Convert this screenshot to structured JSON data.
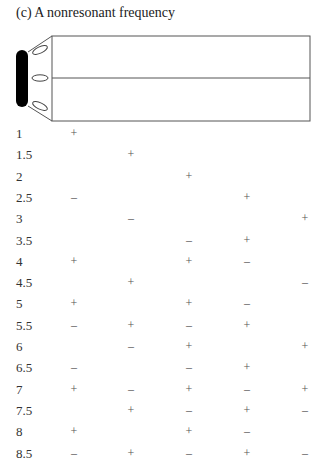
{
  "title": "(c) A nonresonant frequency",
  "figure": {
    "speaker_color": "#000000",
    "tube_line_color": "#555555"
  },
  "table": {
    "columns": 5,
    "rows": [
      {
        "label": "1",
        "signs": [
          "+",
          "",
          "",
          "",
          ""
        ]
      },
      {
        "label": "1.5",
        "signs": [
          "",
          "+",
          "",
          "",
          ""
        ]
      },
      {
        "label": "2",
        "signs": [
          "",
          "",
          "+",
          "",
          ""
        ]
      },
      {
        "label": "2.5",
        "signs": [
          "–",
          "",
          "",
          "+",
          ""
        ]
      },
      {
        "label": "3",
        "signs": [
          "",
          "–",
          "",
          "",
          "+"
        ]
      },
      {
        "label": "3.5",
        "signs": [
          "",
          "",
          "–",
          "+",
          ""
        ]
      },
      {
        "label": "4",
        "signs": [
          "+",
          "",
          "+",
          "–",
          ""
        ]
      },
      {
        "label": "4.5",
        "signs": [
          "",
          "+",
          "",
          "",
          "–"
        ]
      },
      {
        "label": "5",
        "signs": [
          "+",
          "",
          "+",
          "–",
          ""
        ]
      },
      {
        "label": "5.5",
        "signs": [
          "–",
          "+",
          "–",
          "+",
          ""
        ]
      },
      {
        "label": "6",
        "signs": [
          "",
          "–",
          "+",
          "",
          "+"
        ]
      },
      {
        "label": "6.5",
        "signs": [
          "–",
          "",
          "–",
          "+",
          ""
        ]
      },
      {
        "label": "7",
        "signs": [
          "+",
          "–",
          "+",
          "–",
          "+"
        ]
      },
      {
        "label": "7.5",
        "signs": [
          "",
          "+",
          "–",
          "+",
          "–"
        ]
      },
      {
        "label": "8",
        "signs": [
          "+",
          "",
          "+",
          "–",
          ""
        ]
      },
      {
        "label": "8.5",
        "signs": [
          "–",
          "+",
          "–",
          "+",
          "–"
        ]
      }
    ]
  }
}
